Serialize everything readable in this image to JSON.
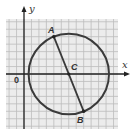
{
  "diagram": {
    "type": "coordinate-plane-circle",
    "axes": {
      "x_label": "x",
      "y_label": "y",
      "origin_label": "0"
    },
    "grid": {
      "cell_px": 7.46,
      "x_min_units": -2.4,
      "x_max_units": 12.6,
      "y_min_units": -7.3,
      "y_max_units": 7.3,
      "line_color": "#b8b8b8",
      "background": "#ebebeb"
    },
    "circle": {
      "center_label": "C",
      "center_units": [
        6,
        0
      ],
      "radius_units": 5.385,
      "stroke_color": "#3a3a3a"
    },
    "points": [
      {
        "label": "A",
        "units": [
          4,
          5
        ]
      },
      {
        "label": "B",
        "units": [
          8,
          -5
        ]
      },
      {
        "label": "C",
        "units": [
          6,
          0
        ]
      }
    ],
    "segment": {
      "from": "A",
      "to": "B",
      "stroke_color": "#3a3a3a"
    }
  }
}
